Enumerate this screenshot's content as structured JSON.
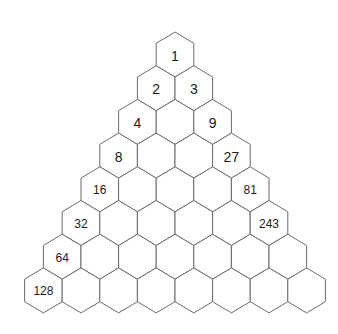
{
  "diagram": {
    "title": "",
    "type": "hexagonal-pyramid",
    "rows": 8,
    "colors": {
      "stroke": "#6b6b6b",
      "fill": "#ffffff",
      "text": "#1a1a1a",
      "background": "#ffffff"
    },
    "geometry": {
      "top_x": 175,
      "top_y": 32,
      "hex_width": 37.6,
      "radius": 22.5,
      "row_step": 33.7
    },
    "cells": [
      [
        "1"
      ],
      [
        "2",
        "3"
      ],
      [
        "4",
        "",
        "9"
      ],
      [
        "8",
        "",
        "",
        "27"
      ],
      [
        "16",
        "",
        "",
        "",
        "81"
      ],
      [
        "32",
        "",
        "",
        "",
        "",
        "243"
      ],
      [
        "64",
        "",
        "",
        "",
        "",
        "",
        ""
      ],
      [
        "128",
        "",
        "",
        "",
        "",
        "",
        "",
        ""
      ]
    ],
    "font_sizes": {
      "1": 14,
      "2": 14,
      "3": 14,
      "4": 14,
      "9": 14,
      "8": 14,
      "27": 14,
      "16": 12,
      "81": 12,
      "32": 12,
      "243": 12,
      "64": 12,
      "128": 12
    }
  }
}
